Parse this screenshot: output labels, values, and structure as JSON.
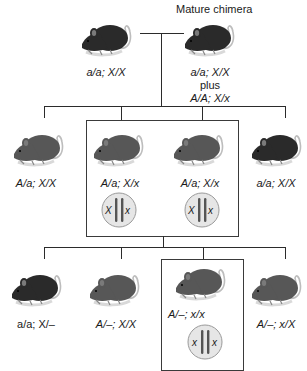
{
  "title": "Mature chimera",
  "generations": {
    "parents": [
      {
        "genotype": "a/a; X/X",
        "coat": "black"
      },
      {
        "genotype_lines": [
          "a/a; X/X",
          "plus",
          "A/A; X/x"
        ],
        "coat": "black",
        "note": "Mature chimera"
      }
    ],
    "f1": [
      {
        "genotype": "A/a; X/X",
        "coat": "agouti"
      },
      {
        "genotype": "A/a; X/x",
        "coat": "agouti",
        "boxed": true,
        "cell": {
          "left": "X",
          "right": "x"
        }
      },
      {
        "genotype": "A/a; X/x",
        "coat": "agouti",
        "boxed": true,
        "cell": {
          "left": "X",
          "right": "x"
        }
      },
      {
        "genotype": "a/a; X/X",
        "coat": "black"
      }
    ],
    "f2": [
      {
        "genotype": "a/a; X/–",
        "coat": "black"
      },
      {
        "genotype": "A/–; X/X",
        "coat": "agouti"
      },
      {
        "genotype": "A/–; x/x",
        "coat": "agouti",
        "boxed": true,
        "cell": {
          "left": "x",
          "right": "x"
        }
      },
      {
        "genotype": "A/–; x/X",
        "coat": "agouti"
      }
    ]
  },
  "colors": {
    "black_mouse": "#2a2a2a",
    "agouti_mouse": "#575757",
    "line": "#2b2b2b",
    "cell_fill": "#e6e6e6",
    "chromosome": "#555555"
  }
}
